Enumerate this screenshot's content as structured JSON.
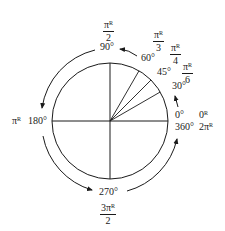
{
  "diagram": {
    "type": "unit-circle-angle-conversion",
    "colors": {
      "stroke": "#1a1a1a",
      "background": "#ffffff"
    },
    "degree_labels": {
      "d0": "0°",
      "d30": "30°",
      "d45": "45°",
      "d60": "60°",
      "d90": "90°",
      "d180": "180°",
      "d270": "270°",
      "d360": "360°"
    },
    "radian_labels": {
      "r0": {
        "text": "0",
        "sup": "R"
      },
      "r2pi": {
        "text": "2π",
        "sup": "R"
      },
      "rpi": {
        "text": "π",
        "sup": "R"
      },
      "rpi6": {
        "num": "π",
        "sup": "R",
        "den": "6"
      },
      "rpi4": {
        "num": "π",
        "sup": "R",
        "den": "4"
      },
      "rpi3": {
        "num": "π",
        "sup": "R",
        "den": "3"
      },
      "rpi2": {
        "num": "π",
        "sup": "R",
        "den": "2"
      },
      "r3pi2": {
        "num": "3π",
        "sup": "R",
        "den": "2"
      }
    },
    "radii_angles_deg": [
      0,
      30,
      45,
      60,
      90,
      180,
      270
    ]
  }
}
